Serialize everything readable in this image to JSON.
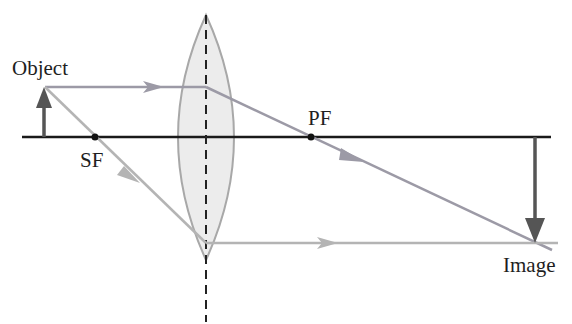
{
  "diagram": {
    "type": "converging-lens-ray-diagram",
    "labels": {
      "object": "Object",
      "image": "Image",
      "secondary_focus": "SF",
      "primary_focus": "PF"
    },
    "colors": {
      "axis": "#1a1a1a",
      "lens_fill": "#ececec",
      "lens_stroke": "#a8a8a8",
      "arrow_object": "#555555",
      "arrow_image": "#555555",
      "ray_top": "#9c9aa6",
      "ray_focal": "#b4b4b4",
      "focus_point": "#111111"
    },
    "geometry": {
      "axis_y": 137,
      "axis_x_start": 22,
      "axis_x_end": 551,
      "lens_center_x": 206,
      "lens_top_y": 15,
      "lens_bottom_y": 260,
      "lens_half_width": 33,
      "object_x": 44,
      "object_top_y": 87,
      "image_x": 535,
      "image_bottom_y": 243,
      "sf_x": 95,
      "pf_x": 311
    }
  }
}
